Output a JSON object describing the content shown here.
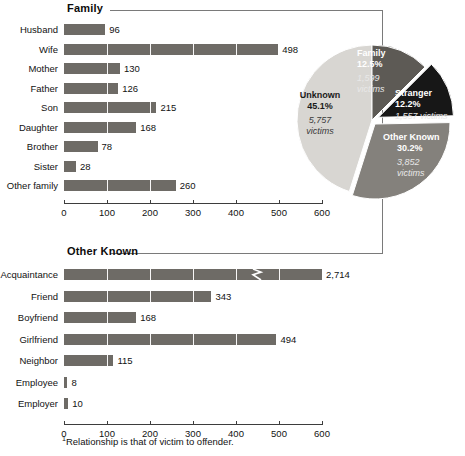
{
  "footnote": {
    "marker": "1",
    "text": "Relationship is that of victim to offender."
  },
  "panels": {
    "family": {
      "title": "Family"
    },
    "other_known": {
      "title": "Other Known"
    }
  },
  "chart_data": [
    {
      "type": "bar",
      "orientation": "horizontal",
      "title": "Family",
      "xlabel": "",
      "ylabel": "",
      "xlim": [
        0,
        600
      ],
      "xticks": [
        0,
        100,
        200,
        300,
        400,
        500,
        600
      ],
      "grid": true,
      "categories": [
        "Husband",
        "Wife",
        "Mother",
        "Father",
        "Son",
        "Daughter",
        "Brother",
        "Sister",
        "Other family"
      ],
      "values": [
        96,
        498,
        130,
        126,
        215,
        168,
        78,
        28,
        260
      ],
      "value_labels": [
        "96",
        "498",
        "130",
        "126",
        "215",
        "168",
        "78",
        "28",
        "260"
      ]
    },
    {
      "type": "bar",
      "orientation": "horizontal",
      "title": "Other Known",
      "xlabel": "",
      "ylabel": "",
      "xlim": [
        0,
        600
      ],
      "xticks": [
        0,
        100,
        200,
        300,
        400,
        500,
        600
      ],
      "grid": true,
      "categories": [
        "Acquaintance",
        "Friend",
        "Boyfriend",
        "Girlfriend",
        "Neighbor",
        "Employee",
        "Employer"
      ],
      "values": [
        2714,
        343,
        168,
        494,
        115,
        8,
        10
      ],
      "value_labels": [
        "2,714",
        "343",
        "168",
        "494",
        "115",
        "8",
        "10"
      ],
      "axis_break": {
        "category": "Acquaintance",
        "note": "bar truncated with zigzag break, true value 2,714"
      }
    },
    {
      "type": "pie",
      "title": "",
      "legend": "in-slice",
      "slices": [
        {
          "label": "Family",
          "percent": 12.5,
          "victims": 1599,
          "victims_label": "1,599",
          "victims_unit": "victims",
          "percent_label": "12.5%",
          "color": "#5d5a55"
        },
        {
          "label": "Stranger",
          "percent": 12.2,
          "victims": 1557,
          "victims_label": "1,557",
          "victims_unit": "victims",
          "percent_label": "12.2%",
          "color": "#171717"
        },
        {
          "label": "Other Known",
          "percent": 30.2,
          "victims": 3852,
          "victims_label": "3,852",
          "victims_unit": "victims",
          "percent_label": "30.2%",
          "color": "#84817c"
        },
        {
          "label": "Unknown",
          "percent": 45.1,
          "victims": 5757,
          "victims_label": "5,757",
          "victims_unit": "victims",
          "percent_label": "45.1%",
          "color": "#d8d6d2"
        }
      ]
    }
  ],
  "family_chart": {
    "ticks": [
      "0",
      "100",
      "200",
      "300",
      "400",
      "500",
      "600"
    ],
    "rows": [
      {
        "label": "Husband",
        "value": 96,
        "value_label": "96"
      },
      {
        "label": "Wife",
        "value": 498,
        "value_label": "498"
      },
      {
        "label": "Mother",
        "value": 130,
        "value_label": "130"
      },
      {
        "label": "Father",
        "value": 126,
        "value_label": "126"
      },
      {
        "label": "Son",
        "value": 215,
        "value_label": "215"
      },
      {
        "label": "Daughter",
        "value": 168,
        "value_label": "168"
      },
      {
        "label": "Brother",
        "value": 78,
        "value_label": "78"
      },
      {
        "label": "Sister",
        "value": 28,
        "value_label": "28"
      },
      {
        "label": "Other family",
        "value": 260,
        "value_label": "260"
      }
    ]
  },
  "other_known_chart": {
    "ticks": [
      "0",
      "100",
      "200",
      "300",
      "400",
      "500",
      "600"
    ],
    "rows": [
      {
        "label": "Acquaintance",
        "value": 2714,
        "value_label": "2,714"
      },
      {
        "label": "Friend",
        "value": 343,
        "value_label": "343"
      },
      {
        "label": "Boyfriend",
        "value": 168,
        "value_label": "168"
      },
      {
        "label": "Girlfriend",
        "value": 494,
        "value_label": "494"
      },
      {
        "label": "Neighbor",
        "value": 115,
        "value_label": "115"
      },
      {
        "label": "Employee",
        "value": 8,
        "value_label": "8"
      },
      {
        "label": "Employer",
        "value": 10,
        "value_label": "10"
      }
    ]
  },
  "pie": {
    "slices": [
      {
        "name": "Family",
        "pct": "12.5%",
        "victims": "1,599",
        "unit": "victims"
      },
      {
        "name": "Stranger",
        "pct": "12.2%",
        "victims": "1,557 victims",
        "unit": ""
      },
      {
        "name": "Other Known",
        "pct": "30.2%",
        "victims": "3,852",
        "unit": "victims"
      },
      {
        "name": "Unknown",
        "pct": "45.1%",
        "victims": "5,757",
        "unit": "victims"
      }
    ]
  }
}
